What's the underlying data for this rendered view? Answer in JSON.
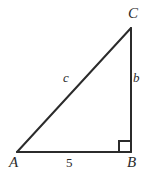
{
  "figure": {
    "kind": "right-triangle-diagram",
    "background_color": "#ffffff",
    "stroke_color": "#2b2b2b",
    "stroke_width": 2,
    "vertices": [
      {
        "name": "A",
        "label": "A",
        "x": 17,
        "y": 152
      },
      {
        "name": "B",
        "label": "B",
        "x": 131,
        "y": 152
      },
      {
        "name": "C",
        "label": "C",
        "x": 131,
        "y": 28
      }
    ],
    "sides": [
      {
        "name": "hypotenuse-AC",
        "label": "c",
        "from": "A",
        "to": "C"
      },
      {
        "name": "leg-BC",
        "label": "b",
        "from": "B",
        "to": "C"
      },
      {
        "name": "leg-AB",
        "label": "5",
        "from": "A",
        "to": "B"
      }
    ],
    "right_angle": {
      "at_vertex": "B",
      "marker": "square",
      "size": 11
    }
  },
  "labels": {
    "vertex_A": "A",
    "vertex_B": "B",
    "vertex_C": "C",
    "side_c": "c",
    "side_b": "b",
    "side_a_measure": "5"
  }
}
